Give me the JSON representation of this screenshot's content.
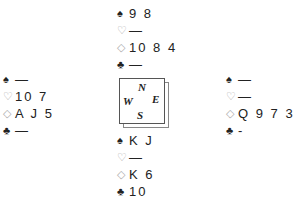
{
  "suit_symbols": {
    "spades": "♠",
    "hearts": "♡",
    "diamonds": "◇",
    "clubs": "♣"
  },
  "hands": {
    "north": {
      "spades": "9 8",
      "hearts": "—",
      "diamonds": "10 8 4",
      "clubs": "—"
    },
    "west": {
      "spades": "—",
      "hearts": "10 7",
      "diamonds": "A J 5",
      "clubs": "—"
    },
    "east": {
      "spades": "—",
      "hearts": "—",
      "diamonds": "Q 9 7 3 2",
      "clubs": "-"
    },
    "south": {
      "spades": "K J",
      "hearts": "—",
      "diamonds": "K 6",
      "clubs": "10"
    }
  },
  "compass": {
    "n": "N",
    "w": "W",
    "e": "E",
    "s": "S"
  }
}
